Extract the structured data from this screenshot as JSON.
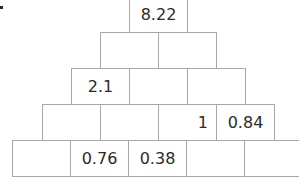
{
  "diagram": {
    "type": "number-pyramid",
    "bullet": "•",
    "rows": [
      {
        "row": 0,
        "cells": [
          "8.22"
        ]
      },
      {
        "row": 1,
        "cells": [
          "",
          ""
        ]
      },
      {
        "row": 2,
        "cells": [
          "2.1",
          "",
          ""
        ]
      },
      {
        "row": 3,
        "cells": [
          "",
          "",
          "1",
          "0.84"
        ]
      },
      {
        "row": 4,
        "cells": [
          "",
          "0.76",
          "0.38",
          "",
          ""
        ]
      }
    ],
    "colors": {
      "border": "#a8a8a8",
      "text": "#2b2b2b",
      "background": "#ffffff"
    }
  }
}
